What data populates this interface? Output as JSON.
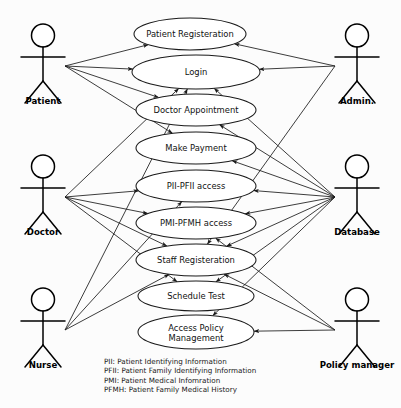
{
  "diagram": {
    "type": "uml-use-case",
    "background_color": "#fcfcfc",
    "line_color": "#1a1a1a"
  },
  "use_cases": [
    {
      "id": "patient-registeration",
      "label": "Patient Registeration",
      "cx": 190,
      "cy": 34,
      "rx": 56,
      "ry": 16
    },
    {
      "id": "login",
      "label": "Login",
      "cx": 196,
      "cy": 72,
      "rx": 64,
      "ry": 17
    },
    {
      "id": "doctor-appointment",
      "label": "Doctor Appointment",
      "cx": 196,
      "cy": 110,
      "rx": 60,
      "ry": 16
    },
    {
      "id": "make-payment",
      "label": "Make Payment",
      "cx": 196,
      "cy": 148,
      "rx": 60,
      "ry": 16
    },
    {
      "id": "pii-pfii-access",
      "label": "PII-PFII access",
      "cx": 196,
      "cy": 186,
      "rx": 60,
      "ry": 16
    },
    {
      "id": "pmi-pfmh-access",
      "label": "PMI-PFMH access",
      "cx": 196,
      "cy": 223,
      "rx": 60,
      "ry": 16
    },
    {
      "id": "staff-registeration",
      "label": "Staff Registeration",
      "cx": 196,
      "cy": 260,
      "rx": 60,
      "ry": 16
    },
    {
      "id": "schedule-test",
      "label": "Schedule Test",
      "cx": 196,
      "cy": 296,
      "rx": 58,
      "ry": 15
    },
    {
      "id": "access-policy-management",
      "label": "Access Policy Management",
      "label_line1": "Access Policy",
      "label_line2": "Management",
      "cx": 196,
      "cy": 332,
      "rx": 58,
      "ry": 17
    }
  ],
  "actors": [
    {
      "id": "patient",
      "label": "Patient",
      "x": 43,
      "y": 24,
      "label_y": 104,
      "side": "left"
    },
    {
      "id": "doctor",
      "label": "Doctor",
      "x": 43,
      "y": 155,
      "label_y": 235,
      "side": "left"
    },
    {
      "id": "nurse",
      "label": "Nurse",
      "x": 43,
      "y": 288,
      "label_y": 368,
      "side": "left"
    },
    {
      "id": "admin",
      "label": "Admin.",
      "x": 357,
      "y": 24,
      "label_y": 104,
      "side": "right"
    },
    {
      "id": "database",
      "label": "Database",
      "x": 357,
      "y": 155,
      "label_y": 235,
      "side": "right"
    },
    {
      "id": "policy-manager",
      "label": "Policy manager",
      "x": 357,
      "y": 288,
      "label_y": 368,
      "side": "right"
    }
  ],
  "associations": [
    {
      "from": "patient",
      "to": "patient-registeration"
    },
    {
      "from": "patient",
      "to": "login"
    },
    {
      "from": "patient",
      "to": "doctor-appointment"
    },
    {
      "from": "patient",
      "to": "make-payment"
    },
    {
      "from": "doctor",
      "to": "login"
    },
    {
      "from": "doctor",
      "to": "pii-pfii-access"
    },
    {
      "from": "doctor",
      "to": "pmi-pfmh-access"
    },
    {
      "from": "doctor",
      "to": "staff-registeration"
    },
    {
      "from": "doctor",
      "to": "schedule-test"
    },
    {
      "from": "nurse",
      "to": "login"
    },
    {
      "from": "nurse",
      "to": "pii-pfii-access"
    },
    {
      "from": "nurse",
      "to": "staff-registeration"
    },
    {
      "from": "admin",
      "to": "patient-registeration"
    },
    {
      "from": "admin",
      "to": "login"
    },
    {
      "from": "admin",
      "to": "staff-registeration"
    },
    {
      "from": "database",
      "to": "login"
    },
    {
      "from": "database",
      "to": "doctor-appointment"
    },
    {
      "from": "database",
      "to": "make-payment"
    },
    {
      "from": "database",
      "to": "pii-pfii-access"
    },
    {
      "from": "database",
      "to": "pmi-pfmh-access"
    },
    {
      "from": "database",
      "to": "staff-registeration"
    },
    {
      "from": "database",
      "to": "schedule-test"
    },
    {
      "from": "database",
      "to": "access-policy-management"
    },
    {
      "from": "policy-manager",
      "to": "pmi-pfmh-access"
    },
    {
      "from": "policy-manager",
      "to": "staff-registeration"
    },
    {
      "from": "policy-manager",
      "to": "access-policy-management"
    }
  ],
  "legend": {
    "lines": [
      "PII: Patient Identifying Information",
      "PFII: Patient Family Identifying Information",
      "PMI: Patient Medical Infomration",
      "PFMH: Patient Family Medical History"
    ],
    "x": 104,
    "y": 364
  }
}
